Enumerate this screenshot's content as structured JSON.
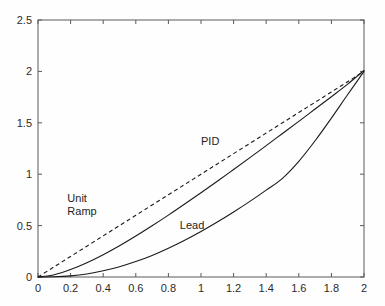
{
  "chart_data": {
    "type": "line",
    "title": "",
    "subtitle": "",
    "xlabel": "",
    "ylabel": "",
    "xlim": [
      0,
      2
    ],
    "ylim": [
      0,
      2.5
    ],
    "grid": false,
    "legend_position": "inline-annotations",
    "x_ticks": [
      "0",
      "0.2",
      "0.4",
      "0.6",
      "0.8",
      "1",
      "1.2",
      "1.4",
      "1.6",
      "1.8",
      "2"
    ],
    "x_tick_values": [
      0,
      0.2,
      0.4,
      0.6,
      0.8,
      1,
      1.2,
      1.4,
      1.6,
      1.8,
      2
    ],
    "y_ticks": [
      "0",
      "0.5",
      "1",
      "1.5",
      "2",
      "2.5"
    ],
    "y_tick_values": [
      0,
      0.5,
      1,
      1.5,
      2,
      2.5
    ],
    "x": [
      0,
      0.1,
      0.2,
      0.3,
      0.4,
      0.5,
      0.6,
      0.7,
      0.8,
      0.9,
      1.0,
      1.1,
      1.2,
      1.3,
      1.4,
      1.5,
      1.6,
      1.7,
      1.8,
      1.9,
      2.0
    ],
    "series": [
      {
        "name": "Unit Ramp",
        "style": "dashed",
        "color": "#1a1a1a",
        "label": "Unit\nRamp",
        "label_line1": "Unit",
        "label_line2": "Ramp",
        "label_x": 0.18,
        "label_y": 0.66,
        "values": [
          0,
          0.1,
          0.2,
          0.3,
          0.4,
          0.5,
          0.6,
          0.7,
          0.8,
          0.9,
          1.0,
          1.1,
          1.2,
          1.3,
          1.4,
          1.5,
          1.6,
          1.7,
          1.8,
          1.9,
          2.0
        ]
      },
      {
        "name": "PID",
        "style": "solid",
        "color": "#1a1a1a",
        "label": "PID",
        "label_x": 1.0,
        "label_y": 1.28,
        "values": [
          0,
          0.022,
          0.072,
          0.138,
          0.216,
          0.303,
          0.398,
          0.498,
          0.602,
          0.71,
          0.82,
          0.932,
          1.046,
          1.161,
          1.278,
          1.396,
          1.514,
          1.634,
          1.754,
          1.876,
          2.01
        ]
      },
      {
        "name": "Lead",
        "style": "solid",
        "color": "#1a1a1a",
        "label": "Lead",
        "label_x": 0.87,
        "label_y": 0.47,
        "values": [
          0,
          0.002,
          0.011,
          0.03,
          0.06,
          0.1,
          0.15,
          0.21,
          0.28,
          0.358,
          0.443,
          0.535,
          0.633,
          0.736,
          0.845,
          0.96,
          1.125,
          1.325,
          1.545,
          1.775,
          2.0
        ]
      }
    ],
    "annotations": [
      {
        "text": "Unit",
        "x": 0.18,
        "y": 0.73
      },
      {
        "text": "Ramp",
        "x": 0.18,
        "y": 0.6
      },
      {
        "text": "PID",
        "x": 1.0,
        "y": 1.28
      },
      {
        "text": "Lead",
        "x": 0.87,
        "y": 0.47
      }
    ],
    "axis_color": "#5a5a5a",
    "background_color": "#fefefe"
  }
}
